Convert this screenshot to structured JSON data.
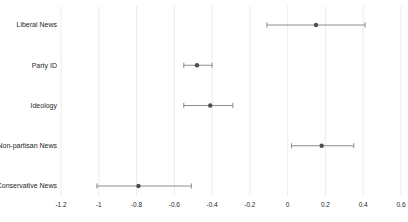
{
  "chart_data": {
    "type": "scatter",
    "subtype": "coefficient-plot-horizontal-error-bars",
    "title": "",
    "xlabel": "",
    "ylabel": "",
    "categories": [
      "Liberal News",
      "Party ID",
      "Ideology",
      "Non-partisan News",
      "Conservative News"
    ],
    "series": [
      {
        "name": "coefficient-estimates",
        "estimates": [
          0.15,
          -0.48,
          -0.41,
          0.18,
          -0.79
        ],
        "ci_low": [
          -0.11,
          -0.55,
          -0.55,
          0.02,
          -1.01
        ],
        "ci_high": [
          0.41,
          -0.4,
          -0.29,
          0.35,
          -0.51
        ]
      }
    ],
    "xlim": [
      -1.2,
      0.6
    ],
    "xticks": [
      -1.2,
      -1,
      -0.8,
      -0.6,
      -0.4,
      -0.2,
      0,
      0.2,
      0.4,
      0.6
    ],
    "xtick_labels": [
      "-1.2",
      "-1",
      "-0.8",
      "-0.6",
      "-0.4",
      "-0.2",
      "0",
      "0.2",
      "0.4",
      "0.6"
    ],
    "grid": "vertical-light",
    "legend": "none",
    "colors": {
      "background": "#ffffff",
      "gridline": "#ececec",
      "error_bar": "#8c8c8c",
      "point": "#4d4d4d",
      "text": "#262626"
    }
  }
}
